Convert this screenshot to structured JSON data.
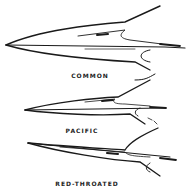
{
  "figure": {
    "bills": [
      {
        "label": "COMMON"
      },
      {
        "label": "PACIFIC"
      },
      {
        "label": "RED-THROATED"
      }
    ]
  },
  "colors": {
    "ink": "#1a1a1a",
    "background": "#ffffff"
  }
}
